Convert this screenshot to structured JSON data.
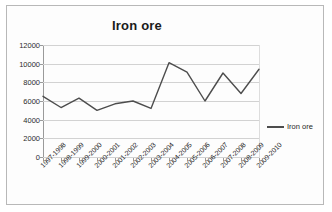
{
  "chart_data": {
    "type": "line",
    "title": "Iron ore",
    "xlabel": "",
    "ylabel": "",
    "ylim": [
      0,
      12000
    ],
    "ytick_step": 2000,
    "yticks": [
      12000,
      10000,
      8000,
      6000,
      4000,
      2000,
      0
    ],
    "grid": true,
    "legend_position": "right",
    "series_color": "#4d4d4d",
    "categories": [
      "1997-1998",
      "1998-1999",
      "1999-2000",
      "2000-2001",
      "2001-2002",
      "2002-2003",
      "2003-2004",
      "2004-2005",
      "2005-2006",
      "2006-2007",
      "2007-2008",
      "2008-2009",
      "2009-2010"
    ],
    "series": [
      {
        "name": "Iron ore",
        "values": [
          6500,
          5300,
          6300,
          5000,
          5700,
          6000,
          5200,
          10100,
          9100,
          6000,
          9000,
          6800,
          9400
        ]
      }
    ]
  },
  "legend": {
    "entries": [
      {
        "label": "Iron ore",
        "color": "#4d4d4d"
      }
    ]
  }
}
